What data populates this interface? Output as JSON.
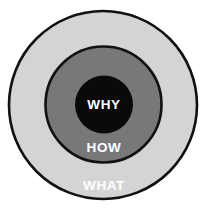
{
  "diagram": {
    "name": "golden-circle",
    "background_color": "#ffffff",
    "stroke_color": "#111111",
    "rings": [
      {
        "id": "what",
        "label": "WHAT",
        "fill": "#d4d4d4",
        "label_color": "#ffffff",
        "cx": 103,
        "cy": 105,
        "r": 94,
        "stroke_width": 2.6,
        "label_x": 104,
        "label_y": 186
      },
      {
        "id": "how",
        "label": "HOW",
        "fill": "#787878",
        "label_color": "#ffffff",
        "cx": 103.5,
        "cy": 104.5,
        "r": 58,
        "stroke_width": 2.6,
        "label_x": 104,
        "label_y": 148
      },
      {
        "id": "why",
        "label": "WHY",
        "fill": "#0a0a0a",
        "label_color": "#ffffff",
        "cx": 104,
        "cy": 104.5,
        "r": 29,
        "stroke_width": 0,
        "label_x": 104,
        "label_y": 105
      }
    ]
  }
}
